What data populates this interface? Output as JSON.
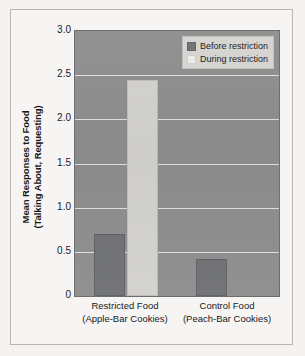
{
  "chart_data": {
    "type": "bar",
    "title": "",
    "xlabel": "",
    "ylabel": "Mean Responses to Food (Talking About, Requesting)",
    "ylabel_line1": "Mean Responses to Food",
    "ylabel_line2": "(Talking About, Requesting)",
    "categories": [
      "Restricted Food (Apple-Bar Cookies)",
      "Control Food (Peach-Bar Cookies)"
    ],
    "category_lines": [
      [
        "Restricted Food",
        "(Apple-Bar Cookies)"
      ],
      [
        "Control Food",
        "(Peach-Bar Cookies)"
      ]
    ],
    "series": [
      {
        "name": "Before restriction",
        "values": [
          0.7,
          0.42
        ],
        "color": "#6f7073"
      },
      {
        "name": "During restriction",
        "values": [
          2.45,
          0.0
        ],
        "color": "#d2d1ce"
      }
    ],
    "ylim": [
      0,
      3.0
    ],
    "yticks": [
      0,
      0.5,
      1.0,
      1.5,
      2.0,
      2.5,
      3.0
    ],
    "ytick_labels": [
      "0",
      "0.5",
      "1.0",
      "1.5",
      "2.0",
      "2.5",
      "3.0"
    ],
    "grid": true,
    "gridlines_at": [
      0.5,
      1.0,
      1.5,
      2.0,
      2.5
    ],
    "legend_position": "top-right",
    "plot_background": "#8d8d8d",
    "gridline_color": "#e9e8e6"
  },
  "legend": {
    "items": [
      {
        "label": "Before restriction",
        "swatch": "before"
      },
      {
        "label": "During restriction",
        "swatch": "during"
      }
    ]
  }
}
